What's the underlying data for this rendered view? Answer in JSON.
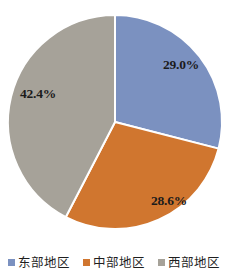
{
  "chart_data": {
    "type": "pie",
    "title": "",
    "xlabel": "",
    "ylabel": "",
    "grid": false,
    "legend_position": "bottom",
    "start_angle_deg": 0,
    "direction": "clockwise",
    "categories": [
      "东部地区",
      "中部地区",
      "西部地区"
    ],
    "values": [
      29.0,
      28.6,
      42.4
    ],
    "value_unit": "%",
    "colors": [
      "#7b91c0",
      "#d0762f",
      "#a6a299"
    ],
    "slice_border_color": "#ffffff",
    "slices": [
      {
        "label": "东部地区",
        "value": 29.0,
        "data_label": "29.0%",
        "color": "#7b91c0",
        "label_x": 181,
        "label_y": 65
      },
      {
        "label": "中部地区",
        "value": 28.6,
        "data_label": "28.6%",
        "color": "#d0762f",
        "label_x": 169,
        "label_y": 201
      },
      {
        "label": "西部地区",
        "value": 42.4,
        "data_label": "42.4%",
        "color": "#a6a299",
        "label_x": 38,
        "label_y": 94
      }
    ]
  },
  "legend": {
    "items": [
      {
        "label": "东部地区",
        "color": "#7b91c0"
      },
      {
        "label": "中部地区",
        "color": "#d0762f"
      },
      {
        "label": "西部地区",
        "color": "#a6a299"
      }
    ]
  }
}
